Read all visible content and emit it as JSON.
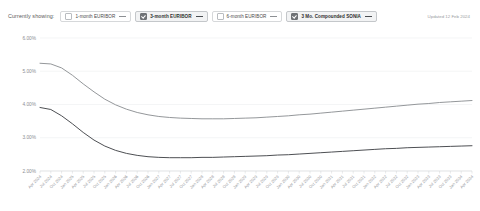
{
  "toolbar": {
    "showing_label": "Currently showing:",
    "updated_text": "Updated 12 Feb 2024",
    "chips": [
      {
        "label": "1-month EURIBOR",
        "checked": false
      },
      {
        "label": "3-month EURIBOR",
        "checked": true
      },
      {
        "label": "6-month EURIBOR",
        "checked": false
      },
      {
        "label": "3 Mo. Compounded SONIA",
        "checked": true
      }
    ]
  },
  "chart_data": {
    "type": "line",
    "title": "",
    "xlabel": "",
    "ylabel": "",
    "ylim": [
      2.0,
      6.0
    ],
    "ytick_labels": [
      "6.00%",
      "5.00%",
      "4.00%",
      "3.00%",
      "2.00%"
    ],
    "ytick_values": [
      6.0,
      5.0,
      4.0,
      3.0,
      2.0
    ],
    "grid": true,
    "legend_position": "top",
    "x": [
      "Apr 2024",
      "Jul 2024",
      "Oct 2024",
      "Jan 2025",
      "Apr 2025",
      "Jul 2025",
      "Oct 2025",
      "Jan 2026",
      "Apr 2026",
      "Jul 2026",
      "Oct 2026",
      "Jan 2027",
      "Apr 2027",
      "Jul 2027",
      "Oct 2027",
      "Jan 2028",
      "Apr 2028",
      "Jul 2028",
      "Oct 2028",
      "Jan 2029",
      "Apr 2029",
      "Jul 2029",
      "Oct 2029",
      "Jan 2030",
      "Apr 2030",
      "Jul 2030",
      "Oct 2030",
      "Jan 2031",
      "Apr 2031",
      "Jul 2031",
      "Oct 2031",
      "Jan 2032",
      "Apr 2032",
      "Jul 2032",
      "Oct 2032",
      "Jan 2033",
      "Apr 2033",
      "Jul 2033",
      "Oct 2033",
      "Jan 2034",
      "Apr 2034"
    ],
    "series": [
      {
        "name": "3 Mo. Compounded SONIA",
        "color": "#8e9195",
        "values": [
          5.24,
          5.22,
          5.1,
          4.88,
          4.62,
          4.38,
          4.16,
          3.99,
          3.86,
          3.76,
          3.69,
          3.64,
          3.61,
          3.59,
          3.58,
          3.57,
          3.57,
          3.57,
          3.58,
          3.59,
          3.6,
          3.62,
          3.64,
          3.66,
          3.69,
          3.71,
          3.74,
          3.77,
          3.8,
          3.83,
          3.86,
          3.89,
          3.92,
          3.95,
          3.98,
          4.01,
          4.03,
          4.06,
          4.08,
          4.1,
          4.12
        ]
      },
      {
        "name": "3-month EURIBOR",
        "color": "#43464a",
        "values": [
          3.91,
          3.85,
          3.66,
          3.42,
          3.16,
          2.93,
          2.75,
          2.62,
          2.53,
          2.47,
          2.43,
          2.41,
          2.4,
          2.4,
          2.4,
          2.41,
          2.41,
          2.42,
          2.43,
          2.44,
          2.45,
          2.46,
          2.48,
          2.49,
          2.51,
          2.53,
          2.55,
          2.57,
          2.59,
          2.61,
          2.63,
          2.65,
          2.67,
          2.68,
          2.7,
          2.71,
          2.72,
          2.73,
          2.74,
          2.75,
          2.76
        ]
      }
    ]
  }
}
